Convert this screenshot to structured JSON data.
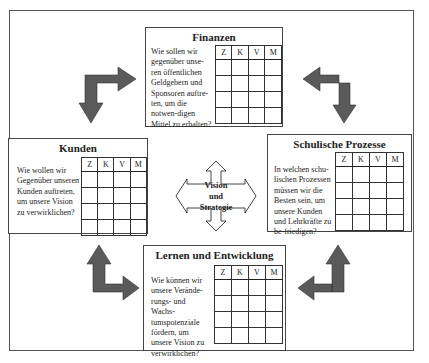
{
  "center": {
    "line1": "Vision",
    "line2": "und",
    "line3": "Strategie"
  },
  "columns": [
    "Z",
    "K",
    "V",
    "M"
  ],
  "boxes": {
    "finanzen": {
      "title": "Finanzen",
      "question": "Wie sollen wir gegenüber unse-ren öffentlichen Geldgebern und Sponsoren auftre-ten, um die notwen-digen Mittel zu erhalten?"
    },
    "kunden": {
      "title": "Kunden",
      "question": "Wie wollen wir Gegenüber unseren Kunden auftreten, um unsere Vision zu verwirklichen?"
    },
    "prozesse": {
      "title": "Schulische Prozesse",
      "question": "In welchen schu-lischen Prozessen müssen wir die Besten sein, um unsere Kunden und Lehrkräfte zu be-friedigen?"
    },
    "lernen": {
      "title": "Lernen und Entwicklung",
      "question": "Wie können wir unsere Verände-rungs- und Wachs-tumspotenziale fördern, um unsere Vision zu verwirklichen?"
    }
  },
  "colors": {
    "arrow": "#5a5a5a",
    "border": "#444444"
  }
}
